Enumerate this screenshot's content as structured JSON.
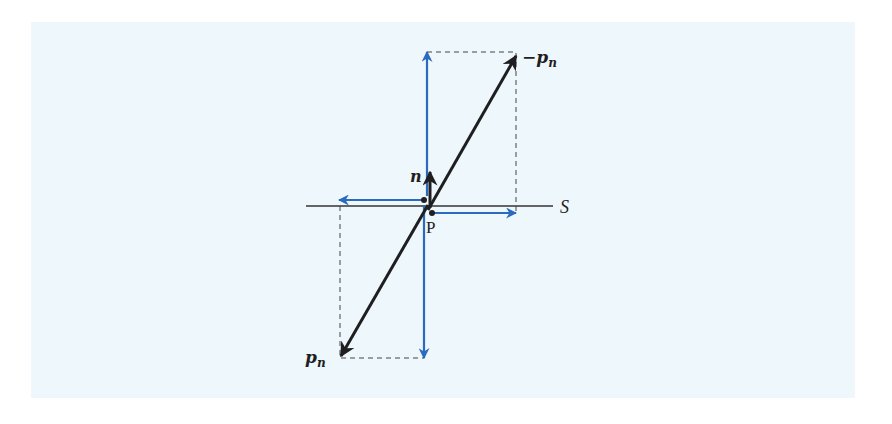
{
  "figure": {
    "colors": {
      "background_panel": "#eef7fb",
      "main_vectors": "#1f1f22",
      "components": "#2a6bbf",
      "surface_line": "#333333",
      "dashed_guides": "#444444"
    },
    "labels": {
      "neg_pn": "−p",
      "neg_pn_sub": "n",
      "pn": "p",
      "pn_sub": "n",
      "normal": "n",
      "point": "P",
      "surface": "S"
    }
  }
}
